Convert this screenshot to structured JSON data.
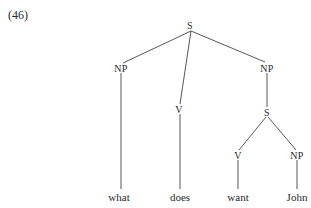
{
  "example_number": "(46)",
  "tree": {
    "nodes": [
      {
        "id": "S",
        "label": "S",
        "x": 190,
        "y": 25
      },
      {
        "id": "NP1",
        "label": "NP",
        "x": 121,
        "y": 68
      },
      {
        "id": "V1",
        "label": "V",
        "x": 179,
        "y": 109
      },
      {
        "id": "NP2",
        "label": "NP",
        "x": 267,
        "y": 68
      },
      {
        "id": "S2",
        "label": "S",
        "x": 267,
        "y": 112
      },
      {
        "id": "V2",
        "label": "V",
        "x": 238,
        "y": 155
      },
      {
        "id": "NP3",
        "label": "NP",
        "x": 297,
        "y": 155
      }
    ],
    "leaves": [
      {
        "label": "what",
        "x": 119,
        "y": 197
      },
      {
        "label": "does",
        "x": 180,
        "y": 197
      },
      {
        "label": "want",
        "x": 238,
        "y": 197
      },
      {
        "label": "John",
        "x": 297,
        "y": 197
      }
    ]
  }
}
